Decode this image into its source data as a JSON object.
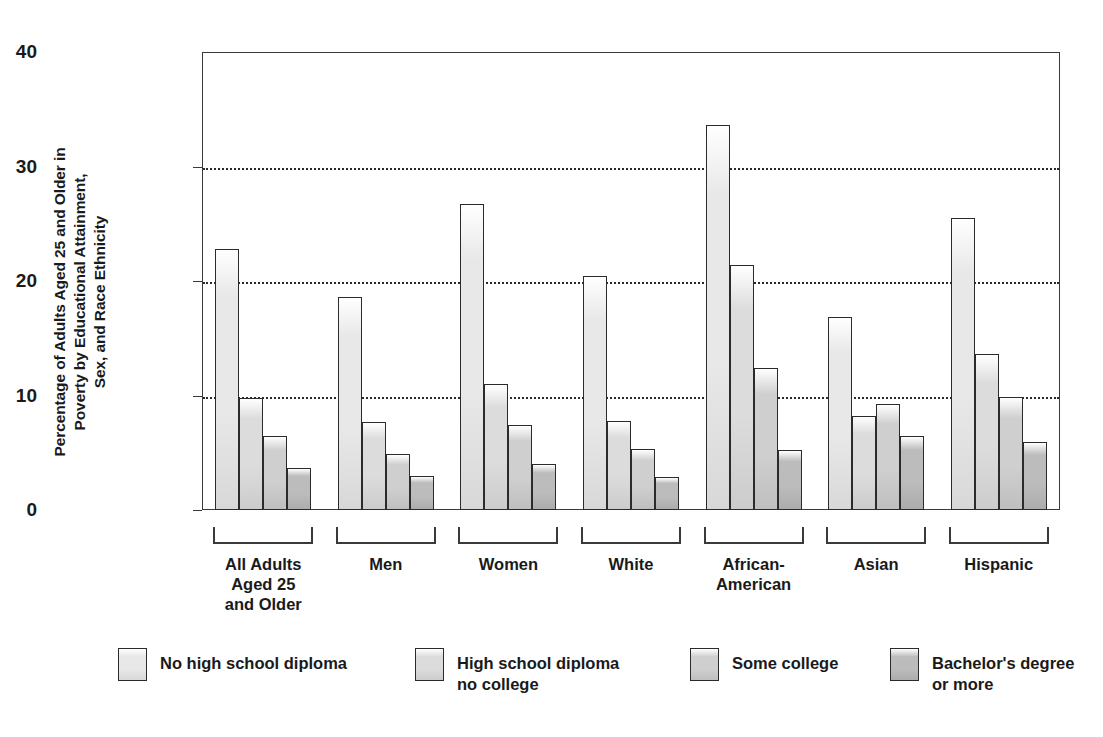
{
  "chart_data": {
    "type": "bar",
    "title": "",
    "subtitle": "",
    "xlabel": "",
    "ylabel": "Percentage of Adults Aged 25 and Older in\nPoverty by Educational Attainment,\nSex, and Race Ethnicity",
    "ylim": [
      0,
      40
    ],
    "ytick_labels": [
      "0",
      "10",
      "20",
      "30",
      "40"
    ],
    "ytick_values": [
      0,
      10,
      20,
      30,
      40
    ],
    "grid": true,
    "grid_axis": "y",
    "grid_style": "dotted",
    "legend_position": "bottom",
    "categories": [
      "All Adults\nAged 25\nand Older",
      "Men",
      "Women",
      "White",
      "African-\nAmerican",
      "Asian",
      "Hispanic"
    ],
    "series": [
      {
        "name": "No high school diploma",
        "color": "#e8e8e8",
        "values": [
          22.8,
          18.6,
          26.7,
          20.4,
          33.6,
          16.9,
          25.5
        ]
      },
      {
        "name": "High school diploma\nno college",
        "color": "#dcdcdc",
        "values": [
          9.8,
          7.7,
          11.0,
          7.8,
          21.4,
          8.2,
          13.6
        ]
      },
      {
        "name": "Some college",
        "color": "#cfcfcf",
        "values": [
          6.5,
          4.9,
          7.4,
          5.3,
          12.4,
          9.3,
          9.9
        ]
      },
      {
        "name": "Bachelor's degree\nor more",
        "color": "#bcbcbc",
        "values": [
          3.7,
          3.0,
          4.0,
          2.9,
          5.2,
          6.5,
          5.9
        ]
      }
    ]
  },
  "legend": {
    "items": [
      {
        "label": "No high school diploma"
      },
      {
        "label": "High school diploma\nno college"
      },
      {
        "label": "Some college"
      },
      {
        "label": "Bachelor's degree\nor more"
      }
    ]
  }
}
